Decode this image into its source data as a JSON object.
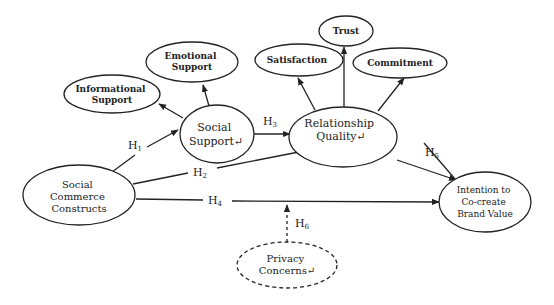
{
  "diagram": {
    "type": "conceptual research model",
    "colors": {
      "stroke": "#222222",
      "text": "#222222",
      "background": "#ffffff"
    },
    "nodes": [
      {
        "id": "informational_support",
        "lines": [
          "Informational",
          "Support"
        ],
        "style": "solid"
      },
      {
        "id": "emotional_support",
        "lines": [
          "Emotional",
          "Support"
        ],
        "style": "solid"
      },
      {
        "id": "social_support",
        "lines": [
          "Social",
          "Support↵"
        ],
        "style": "solid"
      },
      {
        "id": "satisfaction",
        "lines": [
          "Satisfaction"
        ],
        "style": "solid"
      },
      {
        "id": "trust",
        "lines": [
          "Trust"
        ],
        "style": "solid"
      },
      {
        "id": "commitment",
        "lines": [
          "Commitment"
        ],
        "style": "solid"
      },
      {
        "id": "relationship_quality",
        "lines": [
          "Relationship",
          "Quality↵"
        ],
        "style": "solid"
      },
      {
        "id": "social_commerce_constructs",
        "lines": [
          "Social",
          "Commerce",
          "Constructs"
        ],
        "style": "solid"
      },
      {
        "id": "intention",
        "lines": [
          "Intention to",
          "Co-create",
          "Brand Value"
        ],
        "style": "solid"
      },
      {
        "id": "privacy_concerns",
        "lines": [
          "Privacy",
          "Concerns↵"
        ],
        "style": "dashed"
      }
    ],
    "edges": [
      {
        "from": "social_commerce_constructs",
        "to": "social_support",
        "label": "H",
        "sub": "1"
      },
      {
        "from": "social_commerce_constructs",
        "to": "relationship_quality",
        "label": "H",
        "sub": "2"
      },
      {
        "from": "social_support",
        "to": "relationship_quality",
        "label": "H",
        "sub": "3"
      },
      {
        "from": "social_commerce_constructs",
        "to": "intention",
        "label": "H",
        "sub": "4"
      },
      {
        "from": "relationship_quality",
        "to": "intention",
        "label": "H",
        "sub": "5"
      },
      {
        "from": "privacy_concerns",
        "to": "edge_H4",
        "label": "H",
        "sub": "6",
        "style": "dashed"
      },
      {
        "from": "social_support",
        "to": "informational_support",
        "label": ""
      },
      {
        "from": "social_support",
        "to": "emotional_support",
        "label": ""
      },
      {
        "from": "relationship_quality",
        "to": "satisfaction",
        "label": ""
      },
      {
        "from": "relationship_quality",
        "to": "trust",
        "label": ""
      },
      {
        "from": "relationship_quality",
        "to": "commitment",
        "label": ""
      }
    ]
  }
}
